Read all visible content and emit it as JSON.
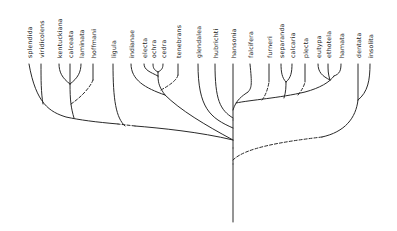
{
  "diagram": {
    "type": "phylogenetic-tree",
    "orientation": "root-bottom, tips-top",
    "taxa": [
      {
        "name": "splendida",
        "x": 29
      },
      {
        "name": "viridicolens",
        "x": 41
      },
      {
        "name": "kentuckiana",
        "x": 59
      },
      {
        "name": "calceata",
        "x": 70
      },
      {
        "name": "laminata",
        "x": 81
      },
      {
        "name": "hoffmani",
        "x": 93
      },
      {
        "name": "ligula",
        "x": 113
      },
      {
        "name": "indianae",
        "x": 131
      },
      {
        "name": "electa",
        "x": 144
      },
      {
        "name": "ochra",
        "x": 153
      },
      {
        "name": "cedra",
        "x": 163
      },
      {
        "name": "tenebrans",
        "x": 178
      },
      {
        "name": "glendalea",
        "x": 198
      },
      {
        "name": "hubrichti",
        "x": 215
      },
      {
        "name": "hansonia",
        "x": 233
      },
      {
        "name": "falcifera",
        "x": 250
      },
      {
        "name": "furneri",
        "x": 269
      },
      {
        "name": "separanda",
        "x": 281
      },
      {
        "name": "calcaria",
        "x": 292
      },
      {
        "name": "plecta",
        "x": 305
      },
      {
        "name": "eutypa",
        "x": 318
      },
      {
        "name": "ethotela",
        "x": 328
      },
      {
        "name": "hamata",
        "x": 341
      },
      {
        "name": "dentata",
        "x": 358
      },
      {
        "name": "insolita",
        "x": 370
      }
    ],
    "label_baseline_y": 58
  }
}
